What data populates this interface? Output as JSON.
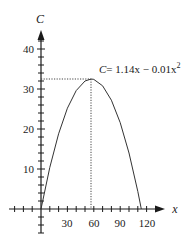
{
  "chart_data": {
    "type": "line",
    "title": "",
    "xlabel": "x",
    "ylabel": "C",
    "xlim": [
      -33,
      140
    ],
    "ylim": [
      -6,
      46
    ],
    "x_ticks": [
      30,
      60,
      90,
      120
    ],
    "x_tick_labels": [
      "30",
      "60",
      "90",
      "120"
    ],
    "y_ticks": [
      10,
      20,
      30,
      40
    ],
    "y_tick_labels": [
      "10",
      "20",
      "30",
      "40"
    ],
    "x_minor_tick_step": 10,
    "y_minor_tick_step": 2,
    "grid": false,
    "legend": null,
    "series": [
      {
        "name": "C = 1.14x - 0.01x^2",
        "x": [
          0,
          10,
          20,
          30,
          40,
          50,
          57,
          60,
          70,
          80,
          90,
          100,
          110,
          114
        ],
        "values": [
          0,
          10.4,
          18.8,
          25.2,
          29.6,
          32.0,
          32.49,
          32.4,
          30.8,
          27.2,
          21.6,
          14.0,
          4.4,
          0
        ]
      }
    ],
    "annotations": [
      {
        "text": "C = 1.14x − 0.01x²",
        "anchor": [
          57,
          32.49
        ]
      },
      {
        "type": "dotted-guide",
        "from": [
          0,
          32.49
        ],
        "to": [
          57,
          32.49
        ]
      },
      {
        "type": "dotted-guide",
        "from": [
          57,
          32.49
        ],
        "to": [
          57,
          0
        ]
      }
    ],
    "vertex": {
      "x": 57,
      "C": 32.49
    }
  },
  "labels": {
    "y_axis": "C",
    "x_axis": "x",
    "equation_lhs": "C",
    "equation_rhs": "= 1.14x − 0.01x",
    "equation_exp": "2",
    "x_ticks": [
      "30",
      "60",
      "90",
      "120"
    ],
    "y_ticks": [
      "10",
      "20",
      "30",
      "40"
    ]
  },
  "colors": {
    "axis": "#1a1a1a",
    "curve": "#333333",
    "guide": "#444444",
    "background": "#ffffff"
  }
}
